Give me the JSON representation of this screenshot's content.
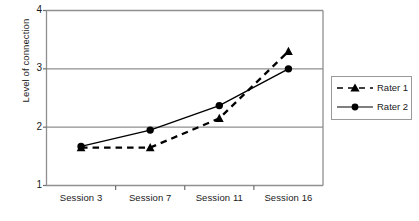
{
  "chart_data": {
    "type": "line",
    "title": "",
    "xlabel": "",
    "ylabel": "Level of connection",
    "categories": [
      "Session 3",
      "Session 7",
      "Session 11",
      "Session 16"
    ],
    "ylim": [
      1,
      4
    ],
    "yticks": [
      1,
      2,
      3,
      4
    ],
    "grid": true,
    "legend_position": "right",
    "series": [
      {
        "name": "Rater 1",
        "values": [
          1.65,
          1.65,
          2.15,
          3.3
        ],
        "line_style": "dashed",
        "marker": "triangle",
        "color": "#000000"
      },
      {
        "name": "Rater 2",
        "values": [
          1.67,
          1.95,
          2.37,
          3.0
        ],
        "line_style": "solid",
        "marker": "circle",
        "color": "#000000"
      }
    ]
  },
  "axes": {
    "y_tick_labels": [
      "4",
      "3",
      "2",
      "1"
    ],
    "y_axis_title": "Level of connection"
  },
  "legend": {
    "entries": [
      {
        "label": "Rater 1"
      },
      {
        "label": "Rater 2"
      }
    ]
  }
}
